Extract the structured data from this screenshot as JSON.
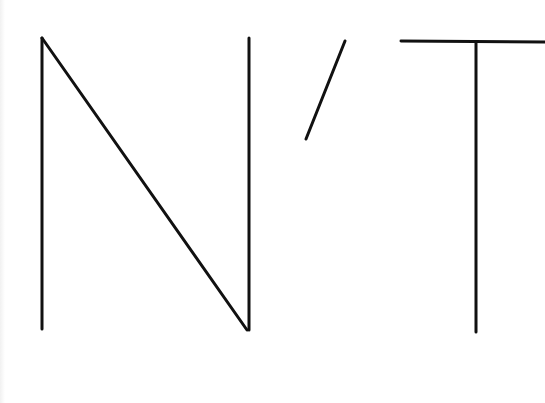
{
  "graphic": {
    "text": "N’T",
    "stroke_color": "#111111",
    "background_color": "#ffffff",
    "stroke_width": 3,
    "glyphs": [
      {
        "char": "N",
        "strokes": [
          {
            "x1": 42,
            "y1": 329,
            "x2": 42,
            "y2": 38
          },
          {
            "x1": 42,
            "y1": 38,
            "x2": 247,
            "y2": 330
          },
          {
            "x1": 249,
            "y1": 330,
            "x2": 249,
            "y2": 38
          }
        ]
      },
      {
        "char": "’",
        "strokes": [
          {
            "x1": 345,
            "y1": 41,
            "x2": 306,
            "y2": 139
          }
        ]
      },
      {
        "char": "T",
        "strokes": [
          {
            "x1": 401,
            "y1": 41,
            "x2": 545,
            "y2": 42
          },
          {
            "x1": 476,
            "y1": 42,
            "x2": 476,
            "y2": 332
          }
        ]
      }
    ]
  }
}
